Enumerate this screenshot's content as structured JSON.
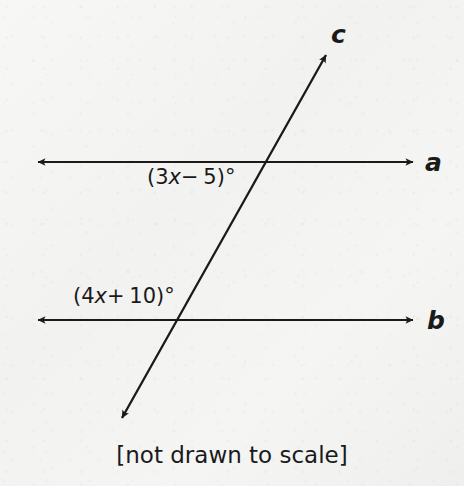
{
  "figure": {
    "caption": "[not drawn to scale]",
    "background_color": "#f4f4f3",
    "stroke_color": "#1a1a1a",
    "lines": [
      {
        "name": "line-a",
        "label": "a",
        "orientation": "horizontal",
        "arrowheads": "both",
        "x1": 33,
        "y1": 162,
        "x2": 418,
        "y2": 162
      },
      {
        "name": "line-b",
        "label": "b",
        "orientation": "horizontal",
        "arrowheads": "both",
        "x1": 33,
        "y1": 320,
        "x2": 418,
        "y2": 320
      },
      {
        "name": "line-c",
        "label": "c",
        "orientation": "transversal",
        "arrowheads": "both",
        "x1": 118,
        "y1": 425,
        "x2": 330,
        "y2": 48
      }
    ],
    "intersections": [
      {
        "name": "intersection-a-c",
        "x": 268,
        "y": 162
      },
      {
        "name": "intersection-b-c",
        "x": 178,
        "y": 320
      }
    ],
    "angles": [
      {
        "name": "angle-top",
        "text": "(3x− 5)°",
        "open_paren": "(",
        "coefficient": "3",
        "variable": "x",
        "operator": "−",
        "constant": "5",
        "close_paren": ")",
        "degree": "°",
        "at_intersection": "intersection-a-c",
        "position": "below-left"
      },
      {
        "name": "angle-bottom",
        "text": "(4x+ 10)°",
        "open_paren": "(",
        "coefficient": "4",
        "variable": "x",
        "operator": "+",
        "constant": "10",
        "close_paren": ")",
        "degree": "°",
        "at_intersection": "intersection-b-c",
        "position": "above-left"
      }
    ]
  }
}
